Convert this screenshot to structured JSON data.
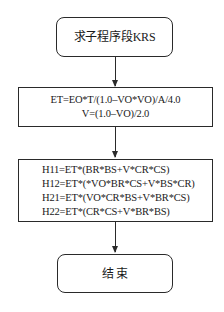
{
  "diagram": {
    "start": {
      "label": "求子程序段KRS"
    },
    "step1": {
      "lines": [
        "ET=EO*T/(1.0–VO*VO)/A/4.0",
        "V=(1.0–VO)/2.0"
      ]
    },
    "step2": {
      "lines": [
        "H11=ET*(BR*BS+V*CR*CS)",
        "H12=ET*(*VO*BR*CS+V*BS*CR)",
        "H21=ET*(VO*CR*BS+V*BR*CS)",
        "H22=ET*(CR*CS+V*BR*BS)"
      ]
    },
    "end": {
      "label": "结 束"
    }
  }
}
